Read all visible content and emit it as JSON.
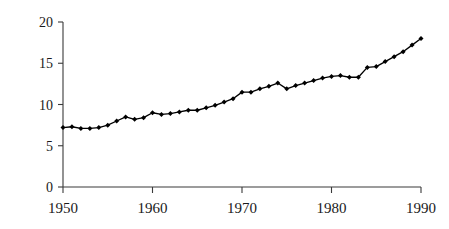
{
  "chart_data": {
    "type": "line",
    "title": "",
    "subtitle": "",
    "xlabel": "",
    "ylabel": "",
    "xlim": [
      1950,
      1990
    ],
    "ylim": [
      0,
      20
    ],
    "grid": false,
    "legend": false,
    "legend_position": "none",
    "marker": "filled-diamond",
    "line_color": "#000000",
    "marker_color": "#000000",
    "axis_color": "#3a3a3a",
    "background_color": "#ffffff",
    "x": [
      1950,
      1951,
      1952,
      1953,
      1954,
      1955,
      1956,
      1957,
      1958,
      1959,
      1960,
      1961,
      1962,
      1963,
      1964,
      1965,
      1966,
      1967,
      1968,
      1969,
      1970,
      1971,
      1972,
      1973,
      1974,
      1975,
      1976,
      1977,
      1978,
      1979,
      1980,
      1981,
      1982,
      1983,
      1984,
      1985,
      1986,
      1987,
      1988,
      1989,
      1990
    ],
    "values": [
      7.2,
      7.3,
      7.1,
      7.1,
      7.2,
      7.5,
      8.0,
      8.5,
      8.2,
      8.4,
      9.0,
      8.8,
      8.9,
      9.1,
      9.3,
      9.3,
      9.6,
      9.9,
      10.3,
      10.7,
      11.5,
      11.5,
      11.9,
      12.2,
      12.6,
      11.9,
      12.3,
      12.6,
      12.9,
      13.2,
      13.4,
      13.5,
      13.3,
      13.3,
      14.5,
      14.6,
      15.2,
      15.8,
      16.4,
      17.2,
      18.0
    ],
    "series": [
      {
        "name": "series-1",
        "values": [
          7.2,
          7.3,
          7.1,
          7.1,
          7.2,
          7.5,
          8.0,
          8.5,
          8.2,
          8.4,
          9.0,
          8.8,
          8.9,
          9.1,
          9.3,
          9.3,
          9.6,
          9.9,
          10.3,
          10.7,
          11.5,
          11.5,
          11.9,
          12.2,
          12.6,
          11.9,
          12.3,
          12.6,
          12.9,
          13.2,
          13.4,
          13.5,
          13.3,
          13.3,
          14.5,
          14.6,
          15.2,
          15.8,
          16.4,
          17.2,
          18.0
        ]
      }
    ],
    "y_ticks": [
      0,
      5,
      10,
      15,
      20
    ],
    "y_tick_labels": [
      "0",
      "5",
      "10",
      "15",
      "20"
    ],
    "x_ticks": [
      1950,
      1960,
      1970,
      1980,
      1990
    ],
    "x_tick_labels": [
      "1950",
      "1960",
      "1970",
      "1980",
      "1990"
    ],
    "annotations": []
  },
  "plot_geometry": {
    "left_px": 63,
    "right_px": 421,
    "top_px": 22,
    "bottom_px": 187
  }
}
